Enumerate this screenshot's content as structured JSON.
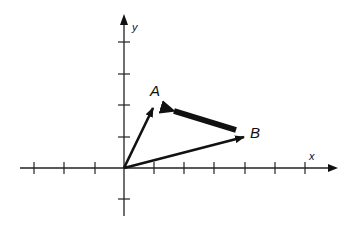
{
  "diagram": {
    "type": "vector-diagram",
    "axes": {
      "x_label": "x",
      "y_label": "y",
      "x_ticks": [
        -3,
        -2,
        -1,
        1,
        2,
        3,
        4,
        5,
        6
      ],
      "y_ticks": [
        -1,
        1,
        2,
        3,
        4
      ],
      "origin_px": [
        124,
        168
      ],
      "unit_px": [
        30.2,
        31.2
      ]
    },
    "points": [
      {
        "id": "A",
        "label": "A",
        "coords": [
          1,
          2
        ]
      },
      {
        "id": "B",
        "label": "B",
        "coords": [
          4,
          1
        ]
      }
    ],
    "vectors": [
      {
        "id": "OA",
        "from": [
          0,
          0
        ],
        "to": [
          1,
          2
        ],
        "style": "normal"
      },
      {
        "id": "OB",
        "from": [
          0,
          0
        ],
        "to": [
          4,
          1
        ],
        "style": "normal"
      },
      {
        "id": "BA",
        "from": [
          4,
          1
        ],
        "to": [
          1,
          2
        ],
        "style": "bold"
      }
    ],
    "colors": {
      "ink": "#111111",
      "background": "#ffffff"
    }
  }
}
